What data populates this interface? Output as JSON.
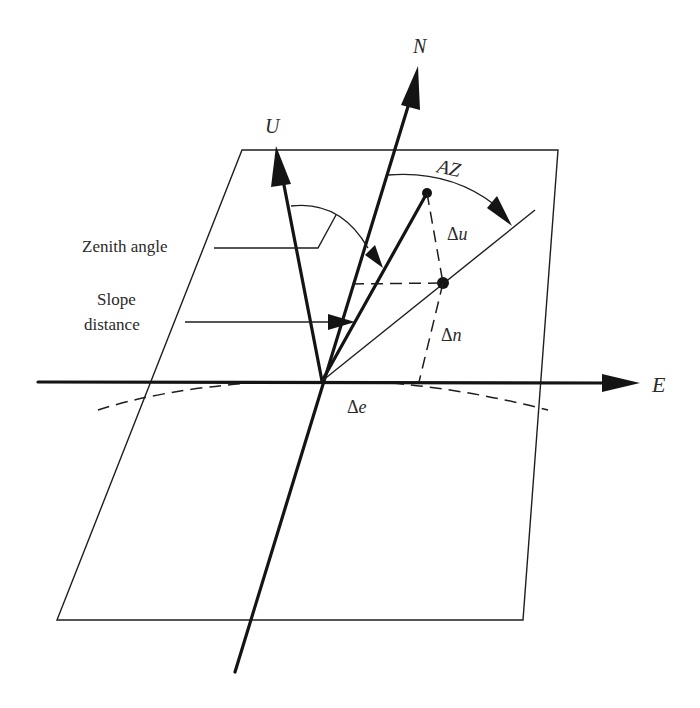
{
  "diagram": {
    "axes": {
      "east": {
        "label": "E"
      },
      "north": {
        "label": "N"
      },
      "up": {
        "label": "U"
      }
    },
    "angles": {
      "azimuth": {
        "label": "AZ"
      },
      "zenith": {
        "label": "Zenith angle"
      }
    },
    "measurements": {
      "slope_distance": {
        "line1": "Slope",
        "line2": "distance"
      },
      "delta_u": {
        "symbol": "Δ",
        "var": "u"
      },
      "delta_n": {
        "symbol": "Δ",
        "var": "n"
      },
      "delta_e": {
        "symbol": "Δ",
        "var": "e"
      }
    },
    "colors": {
      "line": "#141414",
      "text": "#2a2a2a",
      "background": "#ffffff"
    }
  }
}
